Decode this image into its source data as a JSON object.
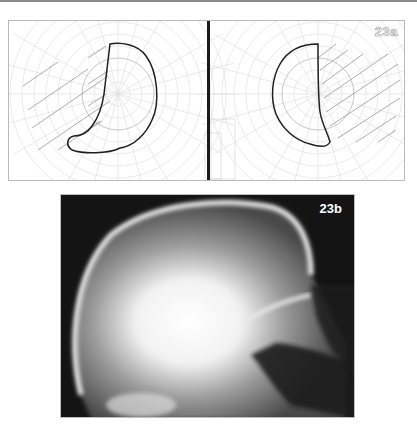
{
  "figure": {
    "top_rule_color": "#8a8a8a",
    "panel_a": {
      "label": "23a",
      "description": "Visual field charts (left and right eye) showing hatched field defects",
      "left_field": {
        "center": [
          109,
          73
        ],
        "hatch_side": "left"
      },
      "right_field": {
        "center": [
          309,
          73
        ],
        "hatch_side": "right"
      },
      "divider_color": "#1a1a1a"
    },
    "panel_b": {
      "label": "23b",
      "description": "Lateral skull radiograph"
    }
  }
}
